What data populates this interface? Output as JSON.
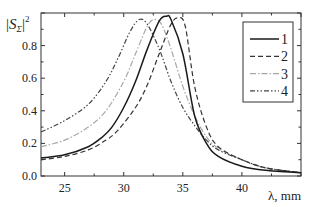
{
  "chart_data": {
    "type": "line",
    "title": "",
    "xlabel": "λ, mm",
    "ylabel": "|S_Σ|²",
    "ylabel_parts": {
      "bar_left": "|",
      "main": "S",
      "sub": "Σ",
      "bar_right": "|",
      "sup": "2"
    },
    "xlim": [
      23,
      45
    ],
    "ylim": [
      0.0,
      1.0
    ],
    "x_ticks": [
      25,
      30,
      35,
      40
    ],
    "x_tick_labels": [
      "25",
      "30",
      "35",
      "40"
    ],
    "y_ticks": [
      0.0,
      0.2,
      0.4,
      0.6,
      0.8
    ],
    "y_tick_labels": [
      "0.0",
      "0.2",
      "0.4",
      "0.6",
      "0.8"
    ],
    "grid": false,
    "legend_position": "upper right",
    "series": [
      {
        "name": "1",
        "style": "solid",
        "color": "#1a1a1a",
        "x": [
          23,
          25,
          27,
          28.2,
          29,
          30,
          31,
          32,
          33,
          33.6,
          34,
          35,
          36,
          37,
          38,
          40,
          42,
          45
        ],
        "values": [
          0.11,
          0.13,
          0.18,
          0.24,
          0.3,
          0.42,
          0.58,
          0.78,
          0.95,
          0.98,
          0.96,
          0.75,
          0.37,
          0.2,
          0.12,
          0.06,
          0.035,
          0.02
        ]
      },
      {
        "name": "2",
        "style": "dashed",
        "color": "#333333",
        "x": [
          23,
          25,
          27,
          28.5,
          29.5,
          31,
          32,
          33,
          34,
          34.6,
          35.2,
          36,
          37,
          38,
          40,
          42,
          45
        ],
        "values": [
          0.1,
          0.12,
          0.16,
          0.22,
          0.28,
          0.42,
          0.56,
          0.75,
          0.93,
          0.97,
          0.92,
          0.55,
          0.3,
          0.18,
          0.1,
          0.05,
          0.02
        ]
      },
      {
        "name": "3",
        "style": "dash-dot",
        "color": "#a8a8a8",
        "x": [
          23,
          25,
          27,
          28.5,
          30,
          31,
          32,
          32.6,
          33.2,
          34,
          35,
          36,
          37,
          38,
          40,
          42,
          45
        ],
        "values": [
          0.18,
          0.22,
          0.3,
          0.4,
          0.58,
          0.75,
          0.92,
          0.96,
          0.93,
          0.78,
          0.55,
          0.37,
          0.24,
          0.17,
          0.1,
          0.05,
          0.02
        ]
      },
      {
        "name": "4",
        "style": "dash-dot-dot",
        "color": "#444444",
        "x": [
          23,
          25,
          27,
          28.5,
          29.5,
          30.5,
          31.3,
          32,
          33,
          34,
          35,
          36,
          37,
          38,
          40,
          42,
          45
        ],
        "values": [
          0.27,
          0.34,
          0.44,
          0.58,
          0.72,
          0.88,
          0.96,
          0.93,
          0.78,
          0.58,
          0.42,
          0.31,
          0.22,
          0.16,
          0.1,
          0.05,
          0.02
        ]
      }
    ]
  },
  "legend": {
    "items": [
      {
        "label": "1",
        "style": "solid"
      },
      {
        "label": "2",
        "style": "dashed"
      },
      {
        "label": "3",
        "style": "dash-dot"
      },
      {
        "label": "4",
        "style": "dash-dot-dot"
      }
    ]
  }
}
